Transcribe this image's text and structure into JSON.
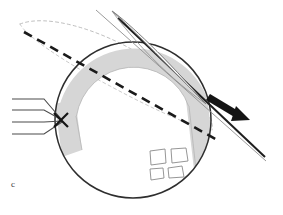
{
  "figure": {
    "panel_label": "c",
    "type": "scientific-schematic",
    "canvas": {
      "width": 283,
      "height": 215,
      "background": "#ffffff"
    }
  },
  "colors": {
    "outline": "#3a3a3a",
    "body_outline": "#2e2e2e",
    "band_fill": "#d6d6d6",
    "band_edge": "#9a9a9a",
    "dashed_heavy": "#1a1a1a",
    "dashed_light": "#b0b0b0",
    "thin_line": "#8f8f8f",
    "arrow_fill": "#141414",
    "ray_line": "#4a4a4a",
    "patch_stroke": "#8a8a8a",
    "background": "#ffffff"
  },
  "elements": {
    "body": {
      "name": "sphere-outline",
      "shape": "circle",
      "cx": 133,
      "cy": 120,
      "r": 78,
      "stroke_width": 1.6
    },
    "crescent_band": {
      "name": "shaded-arc-band",
      "shape": "annular-arc",
      "inner_r": 58,
      "outer_r": 78,
      "start_angle_deg": 196,
      "end_angle_deg": 355,
      "fill": "#d6d6d6"
    },
    "orbit_plane_heavy": {
      "name": "orbit-plane-dashed-line",
      "x1": 24,
      "y1": 32,
      "x2": 219,
      "y2": 141,
      "dash": "9 6",
      "stroke_width": 2.6
    },
    "orbit_ellipse_dashed": {
      "name": "orbit-ellipse-dashed",
      "note": "thin elongated dashed ellipse extending up-left from the body"
    },
    "ring_lens": {
      "name": "ring-lens-shape",
      "tip_x": 112,
      "tip_y": 11,
      "note": "pointed lens/leaf shape crossing the upper right limb"
    },
    "axis_lines": {
      "name": "inclined-axis-lines",
      "count": 2,
      "direction": "upper-left to lower-right",
      "end_x": 266,
      "end_y": 161
    },
    "motion_arrow": {
      "name": "motion-direction-arrow",
      "x1": 211,
      "y1": 96,
      "x2": 249,
      "y2": 120,
      "direction": "down-right"
    },
    "incoming_rays": {
      "name": "incoming-ray-bundle",
      "count": 4,
      "converge_x": 62,
      "converge_y": 121,
      "marker": "x-cross",
      "left_x": 12
    },
    "surface_patches": {
      "name": "surface-patch-group",
      "count": 4,
      "note": "four small quadrilateral patches on the lower right of the sphere"
    }
  }
}
